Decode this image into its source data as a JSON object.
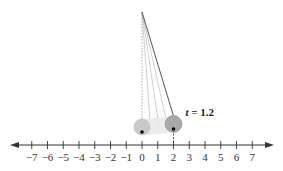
{
  "diagram": {
    "number_line": {
      "min": -7,
      "max": 7,
      "step": 1,
      "tick_labels": [
        "−7",
        "−6",
        "−5",
        "−4",
        "−3",
        "−2",
        "−1",
        "0",
        "1",
        "2",
        "3",
        "4",
        "5",
        "6",
        "7"
      ],
      "arrows": "both"
    },
    "pendulum": {
      "pivot_value": 0,
      "rest_position": 0,
      "current_position": 2,
      "ghost_positions": [
        0.5,
        1.0,
        1.5
      ],
      "time_label_var": "t",
      "time_label_rest": " = 1.2"
    },
    "colors": {
      "axis": "#333333",
      "ball_fill": "#c8c8c8",
      "ball_current_fill": "#a9a9a9",
      "string": "#555555",
      "ghost_string": "#bbbbbb"
    }
  }
}
